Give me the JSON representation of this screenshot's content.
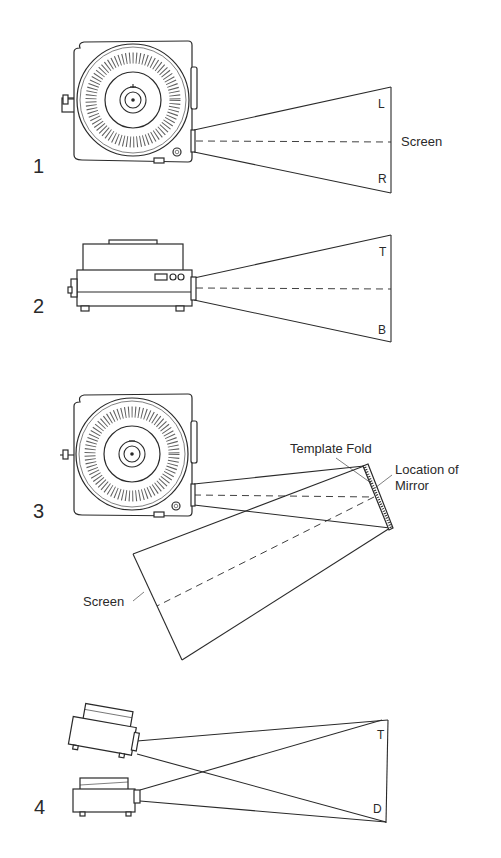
{
  "figures": [
    {
      "number": "1",
      "view": "top view, projector throwing image onto screen",
      "labels": {
        "left_edge": "L",
        "right_edge": "R",
        "screen": "Screen"
      }
    },
    {
      "number": "2",
      "view": "side view, projector throwing image onto screen",
      "labels": {
        "top_edge": "T",
        "bottom_edge": "B"
      }
    },
    {
      "number": "3",
      "view": "top view, projection folded by mirror onto screen",
      "labels": {
        "template_fold": "Template Fold",
        "mirror_line1": "Location of",
        "mirror_line2": "Mirror",
        "screen": "Screen"
      }
    },
    {
      "number": "4",
      "view": "side view, two stacked projectors converging on one screen",
      "labels": {
        "top_edge": "T",
        "bottom_edge": "D"
      }
    }
  ],
  "colors": {
    "ink": "#2a2a2a",
    "paper": "#ffffff"
  }
}
